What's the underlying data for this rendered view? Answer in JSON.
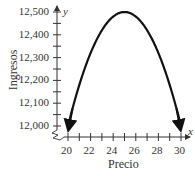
{
  "chart_data": {
    "type": "line",
    "title": "",
    "xlabel": "Precio",
    "ylabel": "Ingresos",
    "x_axis_symbol": "x",
    "y_axis_symbol": "y",
    "xlim": [
      20,
      30
    ],
    "ylim": [
      12000,
      12500
    ],
    "x_ticks": [
      "20",
      "22",
      "24",
      "26",
      "28",
      "30"
    ],
    "y_ticks": [
      "12,000",
      "12,100",
      "12,200",
      "12,300",
      "12,400",
      "12,500"
    ],
    "axis_break": true,
    "grid": false,
    "series": [
      {
        "name": "Ingresos",
        "description": "Parábola con máximo en (25, 12500), flechas en los extremos",
        "x": [
          20,
          21,
          22,
          23,
          24,
          25,
          26,
          27,
          28,
          29,
          30
        ],
        "y": [
          12000,
          12180,
          12320,
          12420,
          12480,
          12500,
          12480,
          12420,
          12320,
          12180,
          12000
        ]
      }
    ]
  }
}
